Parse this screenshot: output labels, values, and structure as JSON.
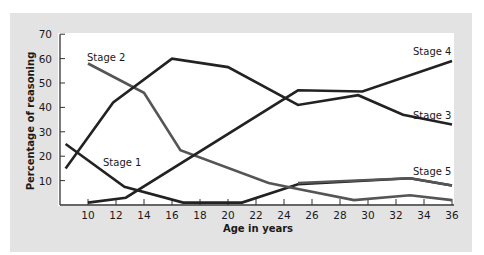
{
  "chart_data": {
    "type": "line",
    "title": "",
    "xlabel": "Age in years",
    "ylabel": "Percentage of reasoning",
    "xlim": [
      8,
      36
    ],
    "ylim": [
      0,
      70
    ],
    "x_ticks": [
      10,
      12,
      14,
      16,
      18,
      20,
      22,
      24,
      26,
      28,
      30,
      32,
      34,
      36
    ],
    "y_ticks": [
      10,
      20,
      30,
      40,
      50,
      60,
      70
    ],
    "grid": false,
    "legend": "inline labels",
    "series": [
      {
        "name": "Stage 1",
        "color": "#222222",
        "points": [
          [
            8.4,
            25
          ],
          [
            12.6,
            7.5
          ],
          [
            16.8,
            1
          ],
          [
            21,
            1
          ],
          [
            25,
            8.5
          ],
          [
            33,
            11
          ],
          [
            36,
            8
          ]
        ]
      },
      {
        "name": "Stage 2",
        "color": "#555555",
        "points": [
          [
            10,
            58
          ],
          [
            14,
            46
          ],
          [
            16.6,
            22.5
          ],
          [
            22.9,
            9
          ],
          [
            25,
            6.5
          ],
          [
            29,
            2
          ],
          [
            33,
            4
          ],
          [
            36,
            2
          ]
        ]
      },
      {
        "name": "Stage 3",
        "color": "#222222",
        "points": [
          [
            8.4,
            15
          ],
          [
            11.8,
            42
          ],
          [
            16,
            60
          ],
          [
            20,
            56.5
          ],
          [
            25,
            41
          ],
          [
            29.3,
            45
          ],
          [
            32.5,
            37
          ],
          [
            36,
            33
          ]
        ]
      },
      {
        "name": "Stage 4",
        "color": "#222222",
        "points": [
          [
            10,
            1
          ],
          [
            12.7,
            3
          ],
          [
            25,
            47
          ],
          [
            29.6,
            46.5
          ],
          [
            36,
            59
          ]
        ]
      },
      {
        "name": "Stage 5",
        "color": "#555555",
        "points": [
          [
            25,
            9
          ],
          [
            33,
            11
          ],
          [
            36,
            8
          ]
        ]
      }
    ],
    "series_labels": [
      {
        "name": "Stage 1",
        "x": 103,
        "y": 166
      },
      {
        "name": "Stage 2",
        "x": 87,
        "y": 61
      },
      {
        "name": "Stage 3",
        "x": 413,
        "y": 119
      },
      {
        "name": "Stage 4",
        "x": 413,
        "y": 55
      },
      {
        "name": "Stage 5",
        "x": 413,
        "y": 175
      }
    ]
  },
  "colors": {
    "panel_background": "#e3e3e3",
    "plot_background": "#ffffff",
    "axis": "#333333",
    "dark_line": "#222222",
    "gray_line": "#555555"
  }
}
